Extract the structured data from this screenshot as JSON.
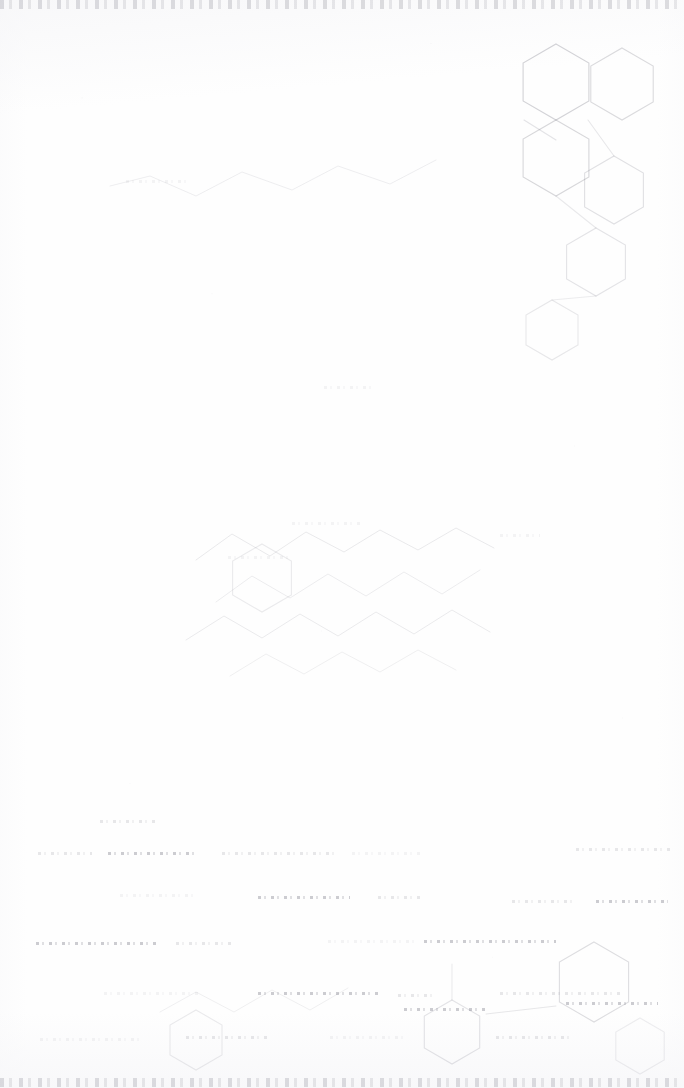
{
  "document": {
    "kind": "scanned-page",
    "condition": "severely-faded",
    "page_width": 684,
    "page_height": 1088,
    "paper_color": "#fefefe",
    "ink_color": "#5a5a69",
    "description": "Near-blank faded scan of a chemical structure page; only ghost outlines of ring systems, zigzag chains and degraded text lines remain."
  },
  "edge_bands": [
    {
      "name": "top-header-remnant",
      "y": 0
    },
    {
      "name": "bottom-footer-remnant",
      "y": 1078
    }
  ],
  "captions": [
    {
      "text": "",
      "x": 0,
      "y": 0,
      "size": 0
    }
  ],
  "chart_data": {
    "type": "diagram",
    "title": "",
    "subtitle": "",
    "xlabel": "",
    "ylabel": "",
    "viewbox": [
      0,
      0,
      684,
      1088
    ],
    "ink": "#5a5a69",
    "rings": [
      {
        "name": "ring-upper-right-a",
        "cx": 556,
        "cy": 82,
        "r": 38,
        "rot": 0,
        "opacity": 0.26
      },
      {
        "name": "ring-upper-right-b",
        "cx": 622,
        "cy": 84,
        "r": 36,
        "rot": 0,
        "opacity": 0.22
      },
      {
        "name": "ring-upper-right-c",
        "cx": 556,
        "cy": 158,
        "r": 38,
        "rot": 0,
        "opacity": 0.24
      },
      {
        "name": "ring-upper-right-d",
        "cx": 614,
        "cy": 190,
        "r": 34,
        "rot": 0,
        "opacity": 0.18
      },
      {
        "name": "ring-upper-right-e",
        "cx": 596,
        "cy": 262,
        "r": 34,
        "rot": 0,
        "opacity": 0.16
      },
      {
        "name": "ring-upper-right-f",
        "cx": 552,
        "cy": 330,
        "r": 30,
        "rot": 0,
        "opacity": 0.14
      },
      {
        "name": "ring-mid-left",
        "cx": 262,
        "cy": 578,
        "r": 34,
        "rot": 0,
        "opacity": 0.12
      },
      {
        "name": "ring-lower-center",
        "cx": 452,
        "cy": 1032,
        "r": 32,
        "rot": 0,
        "opacity": 0.16
      },
      {
        "name": "ring-lower-right",
        "cx": 594,
        "cy": 982,
        "r": 40,
        "rot": 0,
        "opacity": 0.2
      },
      {
        "name": "ring-lower-left",
        "cx": 196,
        "cy": 1040,
        "r": 30,
        "rot": 0,
        "opacity": 0.12
      },
      {
        "name": "ring-footer-right",
        "cx": 640,
        "cy": 1046,
        "r": 28,
        "rot": 0,
        "opacity": 0.1
      }
    ],
    "chains": [
      {
        "name": "chain-upper-wide",
        "points": "110,186 150,176 196,196 242,172 292,190 338,166 390,184 436,160",
        "opacity": 0.1
      },
      {
        "name": "chain-mid-a",
        "points": "196,560 232,534 270,556 306,532 344,552 380,530 418,550 456,528 494,548",
        "opacity": 0.13
      },
      {
        "name": "chain-mid-b",
        "points": "216,602 252,576 290,598 328,574 366,596 404,572 442,594 480,570",
        "opacity": 0.11
      },
      {
        "name": "chain-mid-c",
        "points": "186,640 224,616 262,638 300,614 338,636 376,612 414,634 452,610 490,632",
        "opacity": 0.12
      },
      {
        "name": "chain-mid-d",
        "points": "230,676 266,654 304,674 342,652 380,672 418,650 456,670",
        "opacity": 0.09
      },
      {
        "name": "chain-lower",
        "points": "160,1012 196,992 234,1012 272,990 310,1010 348,988",
        "opacity": 0.09
      }
    ],
    "bonds": [
      {
        "name": "bond-upper-1",
        "x1": 524,
        "y1": 120,
        "x2": 556,
        "y2": 140,
        "opacity": 0.16
      },
      {
        "name": "bond-upper-2",
        "x1": 588,
        "y1": 120,
        "x2": 614,
        "y2": 156,
        "opacity": 0.14
      },
      {
        "name": "bond-upper-3",
        "x1": 556,
        "y1": 196,
        "x2": 596,
        "y2": 228,
        "opacity": 0.13
      },
      {
        "name": "bond-upper-4",
        "x1": 596,
        "y1": 296,
        "x2": 552,
        "y2": 300,
        "opacity": 0.11
      },
      {
        "name": "bond-lower-1",
        "x1": 486,
        "y1": 1014,
        "x2": 556,
        "y2": 1006,
        "opacity": 0.14
      },
      {
        "name": "bond-lower-2",
        "x1": 452,
        "y1": 1000,
        "x2": 452,
        "y2": 964,
        "opacity": 0.12
      }
    ],
    "ghost_text_lines": [
      {
        "name": "ghost-top-01",
        "x": 38,
        "y": 852,
        "w": 54,
        "class": "faint"
      },
      {
        "name": "ghost-top-02",
        "x": 108,
        "y": 852,
        "w": 86,
        "class": ""
      },
      {
        "name": "ghost-top-03",
        "x": 222,
        "y": 852,
        "w": 112,
        "class": "faint"
      },
      {
        "name": "ghost-top-04",
        "x": 352,
        "y": 852,
        "w": 68,
        "class": "vfaint"
      },
      {
        "name": "ghost-top-05",
        "x": 576,
        "y": 848,
        "w": 96,
        "class": "faint"
      },
      {
        "name": "ghost-r2-01",
        "x": 120,
        "y": 894,
        "w": 74,
        "class": "vfaint"
      },
      {
        "name": "ghost-r2-02",
        "x": 258,
        "y": 896,
        "w": 92,
        "class": ""
      },
      {
        "name": "ghost-r2-03",
        "x": 378,
        "y": 896,
        "w": 44,
        "class": "faint"
      },
      {
        "name": "ghost-r2-04",
        "x": 512,
        "y": 900,
        "w": 64,
        "class": "faint"
      },
      {
        "name": "ghost-r2-05",
        "x": 596,
        "y": 900,
        "w": 72,
        "class": ""
      },
      {
        "name": "ghost-r3-01",
        "x": 36,
        "y": 942,
        "w": 122,
        "class": ""
      },
      {
        "name": "ghost-r3-02",
        "x": 176,
        "y": 942,
        "w": 56,
        "class": "faint"
      },
      {
        "name": "ghost-r3-03",
        "x": 328,
        "y": 940,
        "w": 88,
        "class": "vfaint"
      },
      {
        "name": "ghost-r3-04",
        "x": 424,
        "y": 940,
        "w": 132,
        "class": ""
      },
      {
        "name": "ghost-r4-01",
        "x": 104,
        "y": 992,
        "w": 96,
        "class": "vfaint"
      },
      {
        "name": "ghost-r4-02",
        "x": 258,
        "y": 992,
        "w": 120,
        "class": ""
      },
      {
        "name": "ghost-r4-03",
        "x": 398,
        "y": 994,
        "w": 34,
        "class": "faint"
      },
      {
        "name": "ghost-r4-04",
        "x": 500,
        "y": 992,
        "w": 120,
        "class": "faint"
      },
      {
        "name": "ghost-r5-01",
        "x": 40,
        "y": 1038,
        "w": 100,
        "class": "vfaint"
      },
      {
        "name": "ghost-r5-02",
        "x": 186,
        "y": 1036,
        "w": 82,
        "class": "faint"
      },
      {
        "name": "ghost-r5-03",
        "x": 330,
        "y": 1036,
        "w": 74,
        "class": "vfaint"
      },
      {
        "name": "ghost-r5-04",
        "x": 496,
        "y": 1036,
        "w": 78,
        "class": "faint"
      },
      {
        "name": "ghost-mid-01",
        "x": 100,
        "y": 820,
        "w": 56,
        "class": "faint"
      },
      {
        "name": "ghost-mid-02",
        "x": 292,
        "y": 522,
        "w": 70,
        "class": "vfaint"
      },
      {
        "name": "ghost-mid-03",
        "x": 500,
        "y": 534,
        "w": 40,
        "class": "vfaint"
      },
      {
        "name": "ghost-mid-04",
        "x": 228,
        "y": 556,
        "w": 64,
        "class": "vfaint"
      },
      {
        "name": "ghost-mid-05",
        "x": 126,
        "y": 180,
        "w": 60,
        "class": "vfaint"
      },
      {
        "name": "ghost-mid-06",
        "x": 324,
        "y": 386,
        "w": 52,
        "class": "vfaint"
      },
      {
        "name": "ghost-mid-07",
        "x": 566,
        "y": 1002,
        "w": 92,
        "class": ""
      },
      {
        "name": "ghost-mid-08",
        "x": 404,
        "y": 1008,
        "w": 84,
        "class": ""
      }
    ]
  }
}
